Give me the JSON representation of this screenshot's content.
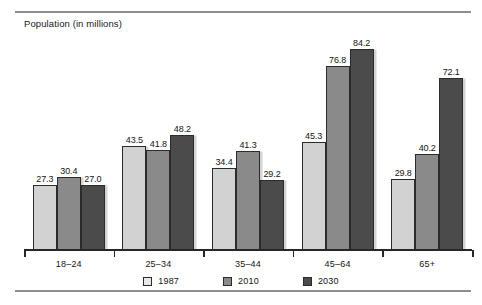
{
  "chart_data": {
    "type": "bar",
    "title": "Population (in millions)",
    "xlabel": "",
    "ylabel": "Population (in millions)",
    "ylim": [
      0,
      92
    ],
    "grid": false,
    "legend_position": "bottom-center",
    "categories": [
      "18–24",
      "25–34",
      "35–44",
      "45–64",
      "65+"
    ],
    "series": [
      {
        "name": "1987",
        "color": "#d2d2d2",
        "values": [
          27.3,
          43.5,
          34.4,
          45.3,
          29.8
        ]
      },
      {
        "name": "2010",
        "color": "#8a8a8a",
        "values": [
          30.4,
          41.8,
          41.3,
          76.8,
          40.2
        ]
      },
      {
        "name": "2030",
        "color": "#4b4b4b",
        "values": [
          27.0,
          48.2,
          29.2,
          84.2,
          72.1
        ]
      }
    ],
    "value_labels": [
      [
        "27.3",
        "30.4",
        "27.0"
      ],
      [
        "43.5",
        "41.8",
        "48.2"
      ],
      [
        "34.4",
        "41.3",
        "29.2"
      ],
      [
        "45.3",
        "76.8",
        "84.2"
      ],
      [
        "29.8",
        "40.2",
        "72.1"
      ]
    ]
  },
  "legend": {
    "items": [
      {
        "label": "1987"
      },
      {
        "label": "2010"
      },
      {
        "label": "2030"
      }
    ]
  }
}
